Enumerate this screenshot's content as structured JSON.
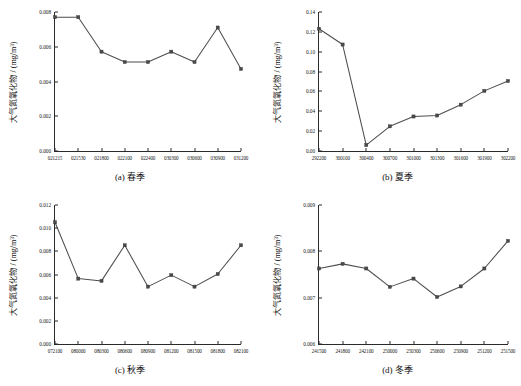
{
  "figure": {
    "ylabel": "大气氮氧化物 / (mg/m³)"
  },
  "chart_data": [
    {
      "type": "line",
      "panel": "a",
      "caption": "(a) 春季",
      "title": "",
      "xlabel": "",
      "ylabel": "大气氮氧化物 / (mg/m³)",
      "categories": [
        "021215",
        "021530",
        "021800",
        "022100",
        "022400",
        "030300",
        "030600",
        "030900",
        "031200"
      ],
      "values": [
        0.0077,
        0.0077,
        0.0057,
        0.0051,
        0.0051,
        0.0057,
        0.0051,
        0.0071,
        0.0047
      ],
      "yticks": [
        "0.000",
        "0.002",
        "0.004",
        "0.006",
        "0.008"
      ],
      "ytickvalues": [
        0.0,
        0.002,
        0.004,
        0.006,
        0.008
      ],
      "ylim": [
        0.0,
        0.008
      ],
      "grid": false,
      "legend": false
    },
    {
      "type": "line",
      "panel": "b",
      "caption": "(b) 夏季",
      "title": "",
      "xlabel": "",
      "ylabel": "大气氮氧化物 / (mg/m³)",
      "categories": [
        "292200",
        "300100",
        "300400",
        "300700",
        "301000",
        "301300",
        "301600",
        "301900",
        "302200"
      ],
      "values": [
        0.123,
        0.107,
        0.005,
        0.024,
        0.034,
        0.035,
        0.046,
        0.06,
        0.07
      ],
      "yticks": [
        "0.00",
        "0.02",
        "0.04",
        "0.06",
        "0.08",
        "0.10",
        "0.12",
        "0.14"
      ],
      "ytickvalues": [
        0.0,
        0.02,
        0.04,
        0.06,
        0.08,
        0.1,
        0.12,
        0.14
      ],
      "ylim": [
        0.0,
        0.14
      ],
      "grid": false,
      "legend": false
    },
    {
      "type": "line",
      "panel": "c",
      "caption": "(c) 秋季",
      "title": "",
      "xlabel": "",
      "ylabel": "大气氮氧化物 / (mg/m³)",
      "categories": [
        "072100",
        "080000",
        "080300",
        "080600",
        "080900",
        "081200",
        "081500",
        "081800",
        "082100"
      ],
      "values": [
        0.0105,
        0.0056,
        0.0054,
        0.0085,
        0.0049,
        0.0059,
        0.0049,
        0.006,
        0.0085
      ],
      "yticks": [
        "0.000",
        "0.002",
        "0.004",
        "0.006",
        "0.008",
        "0.010",
        "0.012"
      ],
      "ytickvalues": [
        0.0,
        0.002,
        0.004,
        0.006,
        0.008,
        0.01,
        0.012
      ],
      "ylim": [
        0.0,
        0.012
      ],
      "grid": false,
      "legend": false
    },
    {
      "type": "line",
      "panel": "d",
      "caption": "(d) 冬季",
      "title": "",
      "xlabel": "",
      "ylabel": "大气氮氧化物 / (mg/m³)",
      "categories": [
        "241500",
        "241800",
        "242100",
        "250000",
        "250300",
        "250600",
        "250900",
        "251200",
        "251500"
      ],
      "values": [
        0.00762,
        0.00772,
        0.00762,
        0.00722,
        0.0074,
        0.007,
        0.00723,
        0.00762,
        0.00822
      ],
      "yticks": [
        "0.006",
        "0.007",
        "0.008",
        "0.009"
      ],
      "ytickvalues": [
        0.006,
        0.007,
        0.008,
        0.009
      ],
      "ylim": [
        0.006,
        0.009
      ],
      "grid": false,
      "legend": false
    }
  ],
  "colors": {
    "line": "#4d4d4d",
    "marker": "#4a4a4a",
    "axis": "#2a2a2a",
    "text": "#111111",
    "background": "#ffffff"
  }
}
